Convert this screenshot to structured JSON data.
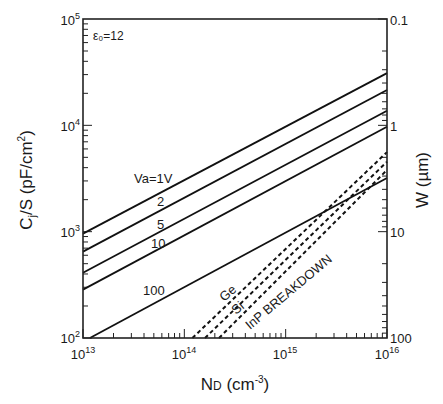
{
  "chart_data": {
    "type": "line",
    "title": "",
    "annotation": "ε₀=12",
    "xlabel": "N_D (cm^-3)",
    "xlabel_main": "N",
    "xlabel_sub": "D",
    "xlabel_rest": " (cm",
    "xlabel_sup": "-3",
    "xlabel_close": ")",
    "ylabel": "C_j/S (pF/cm^2)",
    "ylabel_main": "C",
    "ylabel_sub": "j",
    "ylabel_rest": "/S (pF/cm",
    "ylabel_sup": "2",
    "ylabel_close": ")",
    "y2label": "W (µm)",
    "xscale": "log",
    "yscale": "log",
    "y2scale": "log-inverted",
    "xlim": [
      10000000000000.0,
      1e+16
    ],
    "ylim": [
      100,
      100000
    ],
    "y2lim": [
      100,
      0.1
    ],
    "grid": false,
    "x_ticks": [
      {
        "base": "10",
        "exp": "13",
        "value": 10000000000000.0
      },
      {
        "base": "10",
        "exp": "14",
        "value": 100000000000000.0
      },
      {
        "base": "10",
        "exp": "15",
        "value": 1000000000000000.0
      },
      {
        "base": "10",
        "exp": "16",
        "value": 1e+16
      }
    ],
    "y_ticks": [
      {
        "base": "10",
        "exp": "2",
        "value": 100
      },
      {
        "base": "10",
        "exp": "3",
        "value": 1000
      },
      {
        "base": "10",
        "exp": "4",
        "value": 10000
      },
      {
        "base": "10",
        "exp": "5",
        "value": 100000
      }
    ],
    "y2_ticks": [
      {
        "label": "100",
        "value": 100
      },
      {
        "label": "10",
        "value": 10
      },
      {
        "label": "1",
        "value": 1
      },
      {
        "label": "0.1",
        "value": 0.1
      }
    ],
    "series": [
      {
        "name": "Va=1V",
        "label": "Va=1V",
        "style": "solid",
        "x": [
          10000000000000.0,
          1e+16
        ],
        "y": [
          960,
          31000
        ]
      },
      {
        "name": "Va=2V",
        "label": "2",
        "style": "solid",
        "x": [
          10000000000000.0,
          1e+16
        ],
        "y": [
          650,
          21500
        ]
      },
      {
        "name": "Va=5V",
        "label": "5",
        "style": "solid",
        "x": [
          10000000000000.0,
          1e+16
        ],
        "y": [
          410,
          13700
        ]
      },
      {
        "name": "Va=10V",
        "label": "10",
        "style": "solid",
        "x": [
          10000000000000.0,
          1e+16
        ],
        "y": [
          285,
          9700
        ]
      },
      {
        "name": "Va=100V",
        "label": "100",
        "style": "solid",
        "x": [
          11700000000000.0,
          1e+16
        ],
        "y": [
          100,
          3200
        ]
      },
      {
        "name": "Ge breakdown",
        "label": "Ge",
        "style": "dashed",
        "x": [
          120000000000000.0,
          1e+16
        ],
        "y": [
          100,
          5600
        ]
      },
      {
        "name": "Si breakdown",
        "label": "Si",
        "style": "dashed",
        "x": [
          160000000000000.0,
          1e+16
        ],
        "y": [
          100,
          4550
        ]
      },
      {
        "name": "InP breakdown",
        "label": "InP  BREAKDOWN",
        "style": "dashed",
        "x": [
          220000000000000.0,
          1e+16
        ],
        "y": [
          100,
          3800
        ]
      }
    ]
  }
}
